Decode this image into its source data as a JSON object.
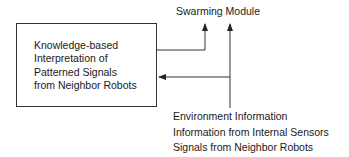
{
  "diagram": {
    "box": {
      "lines": [
        "Knowledge-based",
        "Interpretation of",
        "Patterned Signals",
        "from Neighbor Robots"
      ]
    },
    "output_label": "Swarming Module",
    "inputs": [
      "Environment Information",
      "Information from Internal Sensors",
      "Signals from Neighbor Robots"
    ],
    "colors": {
      "line": "#333333",
      "text": "#1a1a1a"
    }
  }
}
